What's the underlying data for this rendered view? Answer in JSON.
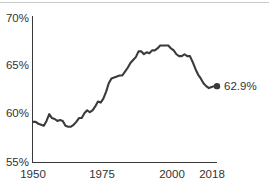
{
  "chart_data": {
    "type": "line",
    "title": "",
    "subtitle": "",
    "xlabel": "",
    "ylabel": "",
    "xlim": [
      1950,
      2018
    ],
    "ylim": [
      55,
      70
    ],
    "grid": false,
    "legend": null,
    "y_ticks": [
      "70%",
      "65%",
      "60%",
      "55%"
    ],
    "y_tick_values": [
      70,
      65,
      60,
      55
    ],
    "x_ticks": [
      "1950",
      "1975",
      "2000",
      "2018"
    ],
    "x_tick_values": [
      1950,
      1975,
      2000,
      2018
    ],
    "annotations": [
      {
        "name": "end-value-label",
        "text": "62.9%",
        "x": 2018,
        "y": 62.9,
        "marker": "dot"
      }
    ],
    "series": [
      {
        "name": "participation-rate",
        "color": "#3b3b3b",
        "x": [
          1950,
          1951,
          1952,
          1953,
          1954,
          1955,
          1956,
          1957,
          1958,
          1959,
          1960,
          1961,
          1962,
          1963,
          1964,
          1965,
          1966,
          1967,
          1968,
          1969,
          1970,
          1971,
          1972,
          1973,
          1974,
          1975,
          1976,
          1977,
          1978,
          1979,
          1980,
          1981,
          1982,
          1983,
          1984,
          1985,
          1986,
          1987,
          1988,
          1989,
          1990,
          1991,
          1992,
          1993,
          1994,
          1995,
          1996,
          1997,
          1998,
          1999,
          2000,
          2001,
          2002,
          2003,
          2004,
          2005,
          2006,
          2007,
          2008,
          2009,
          2010,
          2011,
          2012,
          2013,
          2014,
          2015,
          2016,
          2017,
          2018
        ],
        "values": [
          59.2,
          59.2,
          59.0,
          58.9,
          58.8,
          59.3,
          60.0,
          59.6,
          59.5,
          59.3,
          59.4,
          59.3,
          58.8,
          58.7,
          58.7,
          58.9,
          59.2,
          59.6,
          59.6,
          60.1,
          60.4,
          60.2,
          60.4,
          60.8,
          61.3,
          61.2,
          61.6,
          62.3,
          63.2,
          63.7,
          63.8,
          63.9,
          64.0,
          64.0,
          64.4,
          64.8,
          65.3,
          65.6,
          65.9,
          66.5,
          66.5,
          66.2,
          66.4,
          66.3,
          66.6,
          66.6,
          66.8,
          67.1,
          67.1,
          67.1,
          67.1,
          66.8,
          66.6,
          66.2,
          66.0,
          66.0,
          66.2,
          66.0,
          66.0,
          65.4,
          64.7,
          64.1,
          63.7,
          63.2,
          62.9,
          62.7,
          62.8,
          62.9,
          62.9
        ]
      }
    ]
  },
  "axes": {
    "y_axis_name": "y-axis",
    "x_axis_name": "x-axis"
  }
}
